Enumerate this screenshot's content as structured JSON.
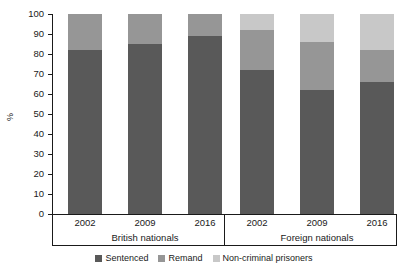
{
  "chart_data": {
    "type": "bar",
    "subtype": "stacked-bar-100",
    "title": "",
    "xlabel": "",
    "ylabel": "%",
    "ylim": [
      0,
      100
    ],
    "yticks": [
      0,
      10,
      20,
      30,
      40,
      50,
      60,
      70,
      80,
      90,
      100
    ],
    "grid": false,
    "legend_position": "bottom-center",
    "categories": [
      "2002",
      "2009",
      "2016",
      "2002",
      "2009",
      "2016"
    ],
    "groups": [
      {
        "label": "British nationals",
        "categories": [
          "2002",
          "2009",
          "2016"
        ]
      },
      {
        "label": "Foreign nationals",
        "categories": [
          "2002",
          "2009",
          "2016"
        ]
      }
    ],
    "series": [
      {
        "name": "Sentenced",
        "color": "#595959",
        "values": [
          82,
          85,
          89,
          72,
          62,
          66
        ]
      },
      {
        "name": "Remand",
        "color": "#969696",
        "values": [
          18,
          15,
          11,
          20,
          24,
          16
        ]
      },
      {
        "name": "Non-criminal prisoners",
        "color": "#c8c8c8",
        "values": [
          0,
          0,
          0,
          8,
          14,
          18
        ]
      }
    ],
    "bars": [
      {
        "group": "British nationals",
        "category": "2002",
        "segments": [
          {
            "name": "Sentenced",
            "value": 82,
            "y0": 0,
            "y1": 82
          },
          {
            "name": "Remand",
            "value": 18,
            "y0": 82,
            "y1": 100
          },
          {
            "name": "Non-criminal prisoners",
            "value": 0,
            "y0": 100,
            "y1": 100
          }
        ]
      },
      {
        "group": "British nationals",
        "category": "2009",
        "segments": [
          {
            "name": "Sentenced",
            "value": 85,
            "y0": 0,
            "y1": 85
          },
          {
            "name": "Remand",
            "value": 15,
            "y0": 85,
            "y1": 100
          },
          {
            "name": "Non-criminal prisoners",
            "value": 0,
            "y0": 100,
            "y1": 100
          }
        ]
      },
      {
        "group": "British nationals",
        "category": "2016",
        "segments": [
          {
            "name": "Sentenced",
            "value": 89,
            "y0": 0,
            "y1": 89
          },
          {
            "name": "Remand",
            "value": 11,
            "y0": 89,
            "y1": 100
          },
          {
            "name": "Non-criminal prisoners",
            "value": 0,
            "y0": 100,
            "y1": 100
          }
        ]
      },
      {
        "group": "Foreign nationals",
        "category": "2002",
        "segments": [
          {
            "name": "Sentenced",
            "value": 72,
            "y0": 0,
            "y1": 72
          },
          {
            "name": "Remand",
            "value": 20,
            "y0": 72,
            "y1": 92
          },
          {
            "name": "Non-criminal prisoners",
            "value": 8,
            "y0": 92,
            "y1": 100
          }
        ]
      },
      {
        "group": "Foreign nationals",
        "category": "2009",
        "segments": [
          {
            "name": "Sentenced",
            "value": 62,
            "y0": 0,
            "y1": 62
          },
          {
            "name": "Remand",
            "value": 24,
            "y0": 62,
            "y1": 86
          },
          {
            "name": "Non-criminal prisoners",
            "value": 14,
            "y0": 86,
            "y1": 100
          }
        ]
      },
      {
        "group": "Foreign nationals",
        "category": "2016",
        "segments": [
          {
            "name": "Sentenced",
            "value": 66,
            "y0": 0,
            "y1": 66
          },
          {
            "name": "Remand",
            "value": 16,
            "y0": 66,
            "y1": 82
          },
          {
            "name": "Non-criminal prisoners",
            "value": 18,
            "y0": 82,
            "y1": 100
          }
        ]
      }
    ],
    "legend": [
      {
        "label": "Sentenced",
        "color": "#595959"
      },
      {
        "label": "Remand",
        "color": "#969696"
      },
      {
        "label": "Non-criminal prisoners",
        "color": "#c8c8c8"
      }
    ]
  },
  "colors": {
    "sentenced": "#595959",
    "remand": "#969696",
    "non_criminal": "#c8c8c8",
    "axis": "#1a1a1a",
    "background": "#ffffff"
  }
}
